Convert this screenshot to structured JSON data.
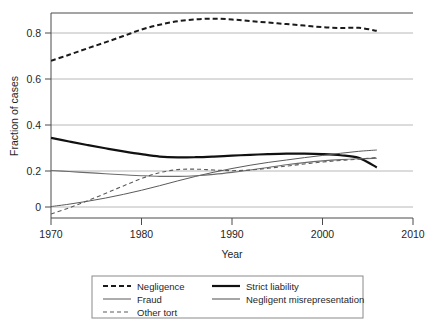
{
  "chart_data": {
    "type": "line",
    "title": "",
    "xlabel": "Year",
    "ylabel": "Fraction of cases",
    "xlim": [
      1970,
      2010
    ],
    "ylim": [
      -0.05,
      0.9
    ],
    "xticks": [
      1970,
      1980,
      1990,
      2000,
      2010
    ],
    "xticklabels": [
      "1970",
      "1980",
      "1990",
      "2000",
      "2010"
    ],
    "yticks": [
      0,
      0.2,
      0.4,
      0.6,
      0.8
    ],
    "yticklabels": [
      "0",
      "0.2",
      "0.4",
      "0.6",
      "0.8"
    ],
    "grid": "horizontal",
    "legend_position": "below-outside",
    "series": [
      {
        "name": "Negligence",
        "style": "dashed",
        "width": 2.0,
        "color": "#1a1a1a",
        "x": [
          1970,
          1972,
          1974,
          1976,
          1978,
          1980,
          1982,
          1984,
          1986,
          1988,
          1990,
          1992,
          1994,
          1996,
          1998,
          2000,
          2002,
          2004,
          2006
        ],
        "y": [
          0.672,
          0.7,
          0.729,
          0.757,
          0.786,
          0.816,
          0.838,
          0.854,
          0.863,
          0.866,
          0.862,
          0.855,
          0.848,
          0.841,
          0.834,
          0.827,
          0.823,
          0.824,
          0.81
        ]
      },
      {
        "name": "Strict liability",
        "style": "solid",
        "width": 2.2,
        "color": "#111111",
        "x": [
          1970,
          1972,
          1974,
          1976,
          1978,
          1980,
          1982,
          1984,
          1986,
          1988,
          1990,
          1992,
          1994,
          1996,
          1998,
          2000,
          2002,
          2004,
          2006
        ],
        "y": [
          0.318,
          0.301,
          0.285,
          0.27,
          0.256,
          0.243,
          0.232,
          0.228,
          0.229,
          0.232,
          0.236,
          0.24,
          0.243,
          0.245,
          0.245,
          0.243,
          0.238,
          0.226,
          0.182
        ]
      },
      {
        "name": "Fraud",
        "style": "solid",
        "width": 1.0,
        "color": "#5a5a5a",
        "x": [
          1970,
          1972,
          1974,
          1976,
          1978,
          1980,
          1982,
          1984,
          1986,
          1988,
          1990,
          1992,
          1994,
          1996,
          1998,
          2000,
          2002,
          2004,
          2006
        ],
        "y": [
          0.002,
          0.013,
          0.026,
          0.041,
          0.058,
          0.077,
          0.098,
          0.12,
          0.141,
          0.16,
          0.177,
          0.192,
          0.205,
          0.216,
          0.227,
          0.237,
          0.247,
          0.256,
          0.262
        ]
      },
      {
        "name": "Negligent misrepresentation",
        "style": "solid",
        "width": 1.1,
        "color": "#6b6b6b",
        "x": [
          1970,
          1972,
          1974,
          1976,
          1978,
          1980,
          1982,
          1984,
          1986,
          1988,
          1990,
          1992,
          1994,
          1996,
          1998,
          2000,
          2002,
          2004,
          2006
        ],
        "y": [
          0.168,
          0.163,
          0.158,
          0.153,
          0.148,
          0.144,
          0.141,
          0.141,
          0.144,
          0.15,
          0.159,
          0.17,
          0.182,
          0.194,
          0.204,
          0.212,
          0.218,
          0.222,
          0.224
        ]
      },
      {
        "name": "Other tort",
        "style": "dashed-fine",
        "width": 1.1,
        "color": "#5a5a5a",
        "x": [
          1970,
          1972,
          1974,
          1976,
          1978,
          1980,
          1982,
          1984,
          1986,
          1988,
          1990,
          1992,
          1994,
          1996,
          1998,
          2000,
          2002,
          2004,
          2006
        ],
        "y": [
          -0.032,
          -0.004,
          0.028,
          0.062,
          0.097,
          0.131,
          0.158,
          0.172,
          0.174,
          0.17,
          0.167,
          0.17,
          0.178,
          0.188,
          0.198,
          0.207,
          0.214,
          0.22,
          0.228
        ]
      }
    ]
  },
  "legend": {
    "entries": [
      {
        "label": "Negligence",
        "style": "dashed",
        "col": 0,
        "row": 0
      },
      {
        "label": "Strict liability",
        "style": "solid-thick",
        "col": 1,
        "row": 0
      },
      {
        "label": "Fraud",
        "style": "solid-thin",
        "col": 0,
        "row": 1
      },
      {
        "label": "Negligent misrepresentation",
        "style": "solid-med",
        "col": 1,
        "row": 1
      },
      {
        "label": "Other tort",
        "style": "dashed-fine",
        "col": 0,
        "row": 2
      }
    ]
  }
}
